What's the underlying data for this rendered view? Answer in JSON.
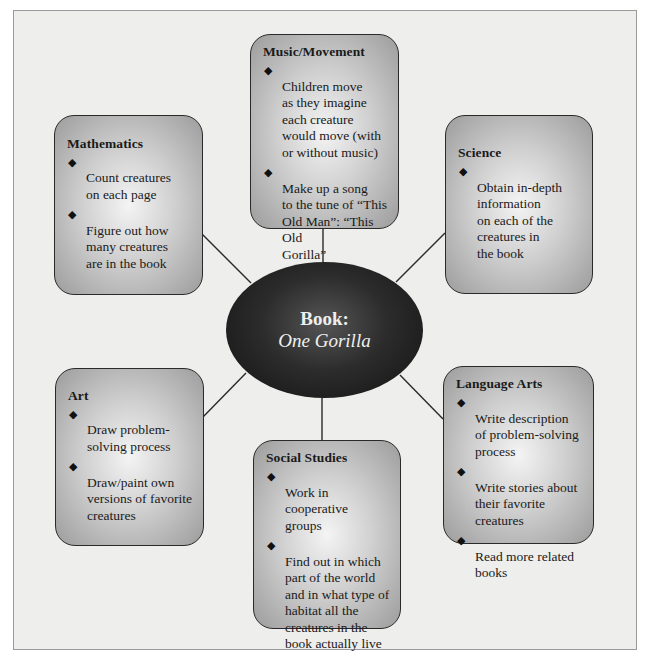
{
  "center": {
    "label": "Book:",
    "title": "One Gorilla"
  },
  "colors": {
    "background": "#eeeeec",
    "frame_border": "#9a9a9a",
    "box_border": "#2a2a2a",
    "box_fill_center": "#f4f4f4",
    "box_fill_edge": "#9c9c9c",
    "ellipse_fill": "#1a1a1a",
    "ellipse_text": "#efefef",
    "connector": "#2a2a2a"
  },
  "bullet_icon": "diamond-icon",
  "boxes": {
    "music": {
      "title": "Music/Movement",
      "items": [
        "Children move\nas they imagine\neach creature\nwould move (with\nor without music)",
        "Make up a song\nto the tune of “This\nOld Man”: “This Old\nGorilla”"
      ]
    },
    "mathematics": {
      "title": "Mathematics",
      "items": [
        "Count creatures\non each page",
        "Figure out how\nmany creatures\nare in the book"
      ]
    },
    "science": {
      "title": "Science",
      "items": [
        "Obtain in-depth\ninformation\non each of the\ncreatures in\nthe book"
      ]
    },
    "art": {
      "title": "Art",
      "items": [
        "Draw problem-\nsolving process",
        "Draw/paint own\nversions of favorite\ncreatures"
      ]
    },
    "social_studies": {
      "title": "Social Studies",
      "items": [
        "Work in cooperative\ngroups",
        "Find out in which\npart of the world\nand in what type of\nhabitat all the\ncreatures in the\nbook actually live"
      ]
    },
    "language_arts": {
      "title": "Language Arts",
      "items": [
        "Write description\nof problem-solving\nprocess",
        "Write stories about\ntheir favorite\ncreatures",
        "Read more related\nbooks"
      ]
    }
  }
}
